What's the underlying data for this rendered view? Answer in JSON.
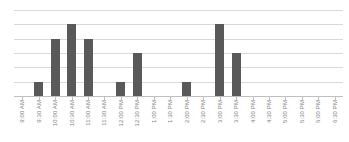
{
  "chart_data": {
    "type": "bar",
    "title": "",
    "subtitle": "",
    "xlabel": "",
    "ylabel": "",
    "legend": [],
    "grid": true,
    "gridline_count": 6,
    "ylim": [
      0,
      6
    ],
    "yticks": [
      0,
      1,
      2,
      3,
      4,
      5,
      6
    ],
    "ytick_labels_visible": false,
    "xtick_label_rotation": -90,
    "bar_color": "#595959",
    "gridline_color": "#d9d9d9",
    "axis_color": "#bfbfbf",
    "label_color": "#7f7f7f",
    "background_color": "#ffffff",
    "categories": [
      "9:00 AM",
      "9:30 AM",
      "10:00 AM",
      "10:30 AM",
      "11:00 AM",
      "11:30 AM",
      "12:00 PM",
      "12:30 PM",
      "1:00 PM",
      "1:30 PM",
      "2:00 PM",
      "2:30 PM",
      "3:00 PM",
      "3:30 PM",
      "4:00 PM",
      "4:30 PM",
      "5:00 PM",
      "5:30 PM",
      "6:00 PM",
      "6:30 PM"
    ],
    "values": [
      0,
      1,
      4,
      5,
      4,
      0,
      1,
      3,
      0,
      0,
      1,
      0,
      5,
      3,
      0,
      0,
      0,
      0,
      0,
      0
    ]
  }
}
